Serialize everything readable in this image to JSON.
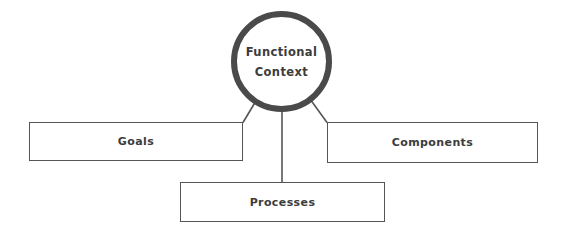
{
  "diagram": {
    "title": "Functional Context",
    "center": {
      "id": "functional-context",
      "label_line1": "Functional",
      "label_line2": "Context",
      "shape": "circle",
      "stroke_color": "#4a4a4a",
      "fill_color": "#ffffff",
      "text_color": "#3c3c3c"
    },
    "nodes": [
      {
        "id": "goals",
        "label": "Goals",
        "shape": "rectangle",
        "stroke_color": "#555555",
        "fill_color": "#ffffff",
        "text_color": "#3c3c3c"
      },
      {
        "id": "components",
        "label": "Components",
        "shape": "rectangle",
        "stroke_color": "#555555",
        "fill_color": "#ffffff",
        "text_color": "#3c3c3c"
      },
      {
        "id": "processes",
        "label": "Processes",
        "shape": "rectangle",
        "stroke_color": "#555555",
        "fill_color": "#ffffff",
        "text_color": "#3c3c3c"
      }
    ],
    "connectors": [
      {
        "id": "center-to-goals",
        "from": "functional-context",
        "to": "goals",
        "style": "diagonal-line",
        "color": "#555555"
      },
      {
        "id": "center-to-components",
        "from": "functional-context",
        "to": "components",
        "style": "diagonal-line",
        "color": "#555555"
      },
      {
        "id": "center-to-processes",
        "from": "functional-context",
        "to": "processes",
        "style": "vertical-line",
        "color": "#555555"
      }
    ],
    "background_color": "#ffffff"
  }
}
